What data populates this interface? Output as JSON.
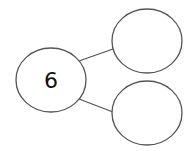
{
  "diagram": {
    "type": "number-bond",
    "whole": {
      "value": "6"
    },
    "parts": [
      {
        "value": ""
      },
      {
        "value": ""
      }
    ],
    "colors": {
      "stroke": "#555555",
      "fill": "#ffffff",
      "text": "#111111"
    }
  }
}
